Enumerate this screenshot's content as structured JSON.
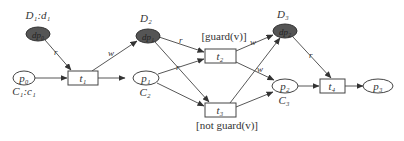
{
  "diagram": {
    "type": "petri-net",
    "places": [
      {
        "id": "p0",
        "label": "p₀",
        "sublabel": "C₁:c₁",
        "kind": "control"
      },
      {
        "id": "p1",
        "label": "p₁",
        "sublabel": "C₂",
        "kind": "control"
      },
      {
        "id": "p2",
        "label": "p₂",
        "sublabel": "C₃",
        "kind": "control"
      },
      {
        "id": "p3",
        "label": "p₃",
        "sublabel": "",
        "kind": "control"
      },
      {
        "id": "dp0",
        "label": "dp₀",
        "sublabel": "D₁:d₁",
        "kind": "data"
      },
      {
        "id": "dp1",
        "label": "dp₁",
        "sublabel": "D₂",
        "kind": "data"
      },
      {
        "id": "dp2",
        "label": "dp₂",
        "sublabel": "D₃",
        "kind": "data"
      }
    ],
    "transitions": [
      {
        "id": "t1",
        "label": "t₁",
        "guard": ""
      },
      {
        "id": "t2",
        "label": "t₂",
        "guard": "[guard(v)]"
      },
      {
        "id": "t3",
        "label": "t₃",
        "guard": "[not guard(v)]"
      },
      {
        "id": "t4",
        "label": "t₄",
        "guard": ""
      }
    ],
    "arc_labels": {
      "read": "r",
      "write": "w"
    },
    "arcs": [
      {
        "from": "p0",
        "to": "t1",
        "label": ""
      },
      {
        "from": "dp0",
        "to": "t1",
        "label": "r"
      },
      {
        "from": "t1",
        "to": "dp1",
        "label": "w"
      },
      {
        "from": "t1",
        "to": "p1",
        "label": ""
      },
      {
        "from": "dp1",
        "to": "t2",
        "label": "r"
      },
      {
        "from": "dp1",
        "to": "t3",
        "label": "r"
      },
      {
        "from": "p1",
        "to": "t2",
        "label": ""
      },
      {
        "from": "p1",
        "to": "t3",
        "label": ""
      },
      {
        "from": "t2",
        "to": "dp2",
        "label": "w"
      },
      {
        "from": "t3",
        "to": "dp2",
        "label": "w"
      },
      {
        "from": "t2",
        "to": "p2",
        "label": ""
      },
      {
        "from": "t3",
        "to": "p2",
        "label": ""
      },
      {
        "from": "dp2",
        "to": "t4",
        "label": "r"
      },
      {
        "from": "p2",
        "to": "t4",
        "label": ""
      },
      {
        "from": "t4",
        "to": "p3",
        "label": ""
      }
    ]
  }
}
